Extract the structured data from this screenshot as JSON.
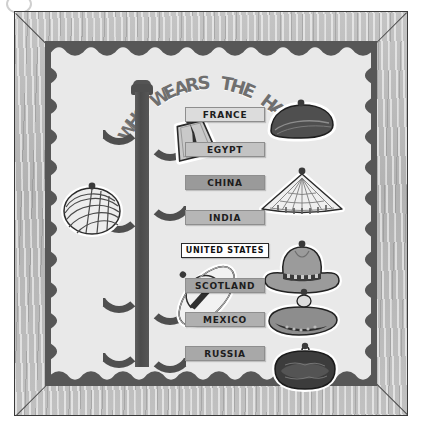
{
  "board": {
    "title": "WHO WEARS THE HAT?",
    "title_letters": [
      "W",
      "H",
      "O",
      "W",
      "E",
      "A",
      "R",
      "S",
      "T",
      "H",
      "E",
      "H",
      "A",
      "T",
      "?"
    ],
    "frame_material": "wood-frame",
    "mat_color": "#575757",
    "poster_color": "#e9e9e9",
    "title_color": "#6f6f6f"
  },
  "coat_rack": {
    "name": "coat-rack",
    "post_color": "#4f4f4f",
    "hook_count": 6
  },
  "labels": [
    {
      "text": "FRANCE",
      "bg": "#dcdcdc",
      "fg": "#1d1d1d",
      "highlight": false
    },
    {
      "text": "EGYPT",
      "bg": "#c3c3c3",
      "fg": "#1d1d1d",
      "highlight": false
    },
    {
      "text": "CHINA",
      "bg": "#9a9a9a",
      "fg": "#1d1d1d",
      "highlight": false
    },
    {
      "text": "INDIA",
      "bg": "#b6b6b6",
      "fg": "#1d1d1d",
      "highlight": false
    },
    {
      "text": "UNITED STATES",
      "bg": "#ffffff",
      "fg": "#111111",
      "highlight": true
    },
    {
      "text": "SCOTLAND",
      "bg": "#a3a3a3",
      "fg": "#1d1d1d",
      "highlight": false
    },
    {
      "text": "MEXICO",
      "bg": "#b0b0b0",
      "fg": "#1d1d1d",
      "highlight": false
    },
    {
      "text": "RUSSIA",
      "bg": "#a8a8a8",
      "fg": "#1d1d1d",
      "highlight": false
    }
  ],
  "hats_left": [
    {
      "name": "fez-hat-sticker",
      "country": "EGYPT",
      "hook": "right-upper"
    },
    {
      "name": "turban-hat-sticker",
      "country": "INDIA",
      "hook": "left-middle"
    },
    {
      "name": "sombrero-hat-sticker",
      "country": "MEXICO",
      "hook": "right-lower"
    }
  ],
  "hats_right": [
    {
      "name": "beret-hat-sticker",
      "country": "FRANCE"
    },
    {
      "name": "conical-hat-sticker",
      "country": "CHINA"
    },
    {
      "name": "cowboy-hat-sticker",
      "country": "UNITED STATES"
    },
    {
      "name": "tam-bonnet-hat-sticker",
      "country": "SCOTLAND"
    },
    {
      "name": "fur-ushanka-hat-sticker",
      "country": "RUSSIA"
    }
  ]
}
